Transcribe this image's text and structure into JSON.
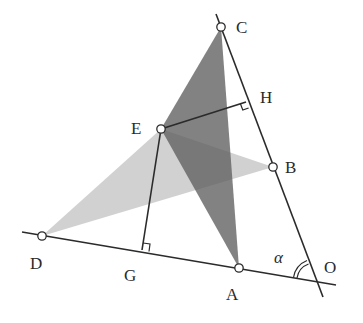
{
  "diagram": {
    "colors": {
      "line": "#2b2b2b",
      "dark_triangle": "#6e6e6e",
      "light_triangle": "#c9c9c9",
      "point_fill": "#ffffff",
      "background": "#ffffff"
    },
    "points": {
      "C": {
        "label": "C",
        "x": 221,
        "y": 27
      },
      "H": {
        "label": "H",
        "x": 246,
        "y": 102
      },
      "E": {
        "label": "E",
        "x": 161,
        "y": 129
      },
      "B": {
        "label": "B",
        "x": 273,
        "y": 167
      },
      "D": {
        "label": "D",
        "x": 42,
        "y": 236
      },
      "G": {
        "label": "G",
        "x": 142,
        "y": 250
      },
      "A": {
        "label": "A",
        "x": 239,
        "y": 268
      },
      "O": {
        "label": "O",
        "x": 315,
        "y": 281
      }
    },
    "angle_label": "α",
    "labels": {
      "C": "C",
      "H": "H",
      "E": "E",
      "B": "B",
      "D": "D",
      "G": "G",
      "A": "A",
      "O": "O",
      "alpha": "α"
    },
    "triangles": [
      {
        "name": "triangle-CEA",
        "vertices": [
          "C",
          "E",
          "A"
        ],
        "shade": "dark"
      },
      {
        "name": "triangle-EDB",
        "vertices": [
          "E",
          "D",
          "B"
        ],
        "shade": "light"
      }
    ],
    "segments": [
      {
        "name": "line-OD",
        "from": "O",
        "to": "D"
      },
      {
        "name": "line-OC",
        "from": "O",
        "to": "C"
      },
      {
        "name": "segment-EH",
        "from": "E",
        "to": "H",
        "perpendicular_to": "OC"
      },
      {
        "name": "segment-EG",
        "from": "E",
        "to": "G",
        "perpendicular_to": "OD"
      }
    ],
    "right_angle_marks": [
      "H",
      "G"
    ]
  }
}
